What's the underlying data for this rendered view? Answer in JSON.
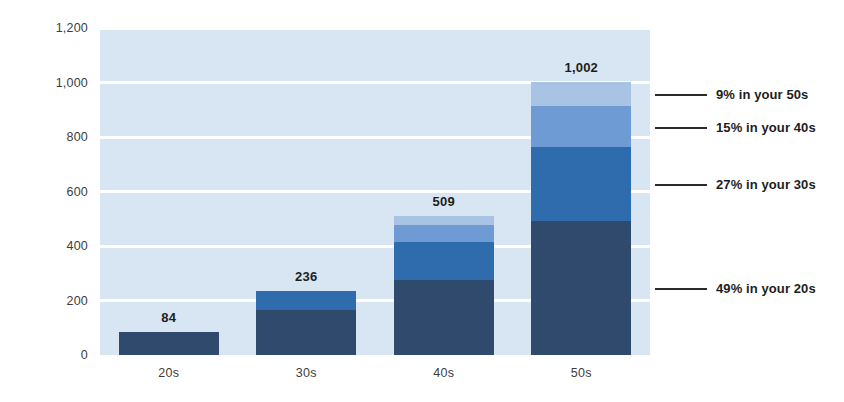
{
  "chart_data": {
    "type": "bar",
    "title": "",
    "subtitle": "",
    "xlabel": "",
    "ylabel": "",
    "stacked": true,
    "grid": true,
    "legend_position": "none",
    "categories": [
      "20s",
      "30s",
      "40s",
      "50s"
    ],
    "x_tick_labels": [
      "20s",
      "30s",
      "40s",
      "50s"
    ],
    "y_tick_labels": [
      "0",
      "200",
      "400",
      "600",
      "800",
      "1,000",
      "1,200"
    ],
    "y_ticks": [
      0,
      200,
      400,
      600,
      800,
      1000,
      1200
    ],
    "ylim": [
      0,
      1200
    ],
    "totals": [
      84,
      236,
      509,
      1002
    ],
    "total_labels": [
      "84",
      "236",
      "509",
      "1,002"
    ],
    "series": [
      {
        "name": "in your 20s",
        "color": "#2f4a6d",
        "values": [
          84,
          165,
          277,
          491
        ],
        "percent_label": "49% in your 20s",
        "percent": 49
      },
      {
        "name": "in your 30s",
        "color": "#2e6cae",
        "values": [
          0,
          71,
          139,
          271
        ],
        "percent_label": "27% in your 30s",
        "percent": 27
      },
      {
        "name": "in your 40s",
        "color": "#6f9bd5",
        "values": [
          0,
          0,
          60,
          150
        ],
        "percent_label": "15% in your 40s",
        "percent": 15
      },
      {
        "name": "in your 50s",
        "color": "#a9c3e5",
        "values": [
          0,
          0,
          33,
          90
        ],
        "percent_label": "9% in your 50s",
        "percent": 9
      }
    ],
    "annotations": [
      {
        "text": "9% in your 50s",
        "series": "in your 50s"
      },
      {
        "text": "15% in your 40s",
        "series": "in your 40s"
      },
      {
        "text": "27% in your 30s",
        "series": "in your 30s"
      },
      {
        "text": "49% in your 20s",
        "series": "in your 20s"
      }
    ],
    "colors": {
      "plot_background": "#d8e6f4",
      "gridline": "#ffffff",
      "text": "#3d3d3d",
      "label_text": "#1d1d1d",
      "leader_line": "#2b2b2b"
    }
  }
}
